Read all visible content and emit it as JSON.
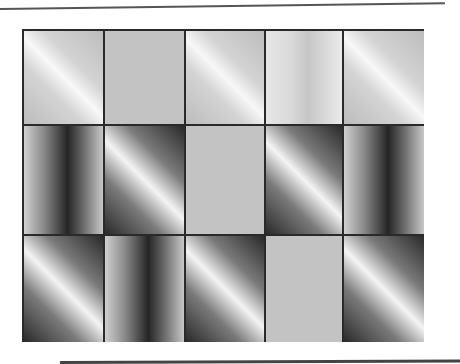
{
  "colors": {
    "frame": "#2a2a2a",
    "flat_gray": "#c3c3c3",
    "rule": "#555555"
  },
  "grid": {
    "rows": 3,
    "columns": 5,
    "tiles": [
      [
        "diag-light",
        "flat",
        "diag-light",
        "vert-light",
        "diag-light"
      ],
      [
        "vert-dark",
        "diag-dark",
        "flat",
        "diag-dark",
        "vert-dark"
      ],
      [
        "diag-dark",
        "vert-dark",
        "diag-dark",
        "flat",
        "diag-dark"
      ]
    ]
  }
}
